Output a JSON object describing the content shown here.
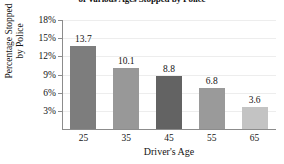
{
  "chart_data": {
    "type": "bar",
    "title": "of Various Ages Stopped by Police",
    "xlabel": "Driver's Age",
    "ylabel_line1": "Percentage Stopped",
    "ylabel_line2": "by Police",
    "categories": [
      "25",
      "35",
      "45",
      "55",
      "65"
    ],
    "values": [
      13.7,
      10.1,
      8.8,
      6.8,
      3.6
    ],
    "value_labels": [
      "13.7",
      "10.1",
      "8.8",
      "6.8",
      "3.6"
    ],
    "bar_colors": [
      "#7d7d7d",
      "#989898",
      "#636363",
      "#9a9a9a",
      "#c3c3c3"
    ],
    "ylim": [
      0,
      18
    ],
    "yticks": [
      3,
      6,
      9,
      12,
      15,
      18
    ],
    "ytick_labels": [
      "3%",
      "6%",
      "9%",
      "12%",
      "15%",
      "18%"
    ],
    "grid": true,
    "legend": "none",
    "axis_color": "#8c8c8c",
    "gridline_color": "#ededed"
  }
}
